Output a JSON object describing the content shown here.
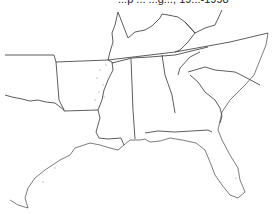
{
  "map": {
    "title_partial": "...p ...  ...g...,  19...-1998",
    "region": "Southeastern United States",
    "states_shown": [
      "Oklahoma",
      "Texas",
      "Arkansas",
      "Louisiana",
      "Missouri",
      "Kentucky",
      "Tennessee",
      "Mississippi",
      "Alabama",
      "Georgia",
      "Florida",
      "South Carolina",
      "North Carolina",
      "Virginia"
    ],
    "colors": {
      "boundary": "#333333",
      "background": "#ffffff",
      "stipple": "#bbbbbb"
    }
  }
}
